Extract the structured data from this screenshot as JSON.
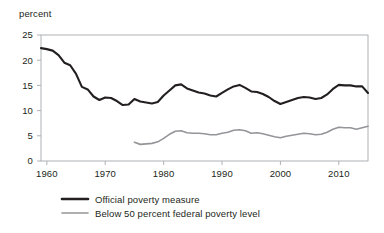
{
  "chart_data": {
    "type": "line",
    "title": "",
    "subtitle": "",
    "xlabel": "",
    "ylabel": "percent",
    "unit_label": "percent",
    "xlim": [
      1959,
      2015
    ],
    "ylim": [
      0,
      25
    ],
    "grid": false,
    "legend_position": "bottom",
    "y_ticks": [
      0,
      5,
      10,
      15,
      20,
      25
    ],
    "y_tick_labels": [
      "0",
      "5",
      "10",
      "15",
      "20",
      "25"
    ],
    "x_ticks": [
      1960,
      1970,
      1980,
      1990,
      2000,
      2010
    ],
    "x_tick_labels": [
      "1960",
      "1970",
      "1980",
      "1990",
      "2000",
      "2010"
    ],
    "series": [
      {
        "name": "Official poverty measure",
        "color": "#231f20",
        "width": 2.1,
        "x": [
          1959,
          1960,
          1961,
          1962,
          1963,
          1964,
          1965,
          1966,
          1967,
          1968,
          1969,
          1970,
          1971,
          1972,
          1973,
          1974,
          1975,
          1976,
          1977,
          1978,
          1979,
          1980,
          1981,
          1982,
          1983,
          1984,
          1985,
          1986,
          1987,
          1988,
          1989,
          1990,
          1991,
          1992,
          1993,
          1994,
          1995,
          1996,
          1997,
          1998,
          1999,
          2000,
          2001,
          2002,
          2003,
          2004,
          2005,
          2006,
          2007,
          2008,
          2009,
          2010,
          2011,
          2012,
          2013,
          2014,
          2015
        ],
        "values": [
          22.4,
          22.2,
          21.9,
          21.0,
          19.5,
          19.0,
          17.3,
          14.7,
          14.2,
          12.8,
          12.1,
          12.6,
          12.5,
          11.9,
          11.1,
          11.2,
          12.3,
          11.8,
          11.6,
          11.4,
          11.7,
          13.0,
          14.0,
          15.0,
          15.2,
          14.4,
          14.0,
          13.6,
          13.4,
          13.0,
          12.8,
          13.5,
          14.2,
          14.8,
          15.1,
          14.5,
          13.8,
          13.7,
          13.3,
          12.7,
          11.9,
          11.3,
          11.7,
          12.1,
          12.5,
          12.7,
          12.6,
          12.3,
          12.5,
          13.2,
          14.3,
          15.1,
          15.0,
          15.0,
          14.8,
          14.8,
          13.5
        ]
      },
      {
        "name": "Below 50 percent federal poverty level",
        "color": "#939598",
        "width": 1.6,
        "x": [
          1975,
          1976,
          1977,
          1978,
          1979,
          1980,
          1981,
          1982,
          1983,
          1984,
          1985,
          1986,
          1987,
          1988,
          1989,
          1990,
          1991,
          1992,
          1993,
          1994,
          1995,
          1996,
          1997,
          1998,
          1999,
          2000,
          2001,
          2002,
          2003,
          2004,
          2005,
          2006,
          2007,
          2008,
          2009,
          2010,
          2011,
          2012,
          2013,
          2014,
          2015
        ],
        "values": [
          3.7,
          3.3,
          3.4,
          3.5,
          3.8,
          4.5,
          5.3,
          5.9,
          6.0,
          5.6,
          5.5,
          5.5,
          5.4,
          5.2,
          5.2,
          5.5,
          5.7,
          6.1,
          6.2,
          6.0,
          5.5,
          5.6,
          5.4,
          5.1,
          4.8,
          4.6,
          4.9,
          5.1,
          5.3,
          5.5,
          5.4,
          5.2,
          5.3,
          5.7,
          6.3,
          6.7,
          6.6,
          6.6,
          6.3,
          6.6,
          6.9
        ]
      }
    ]
  },
  "legend": {
    "items": [
      {
        "label": "Official poverty measure",
        "color": "#231f20"
      },
      {
        "label": "Below 50 percent federal poverty level",
        "color": "#939598"
      }
    ]
  }
}
